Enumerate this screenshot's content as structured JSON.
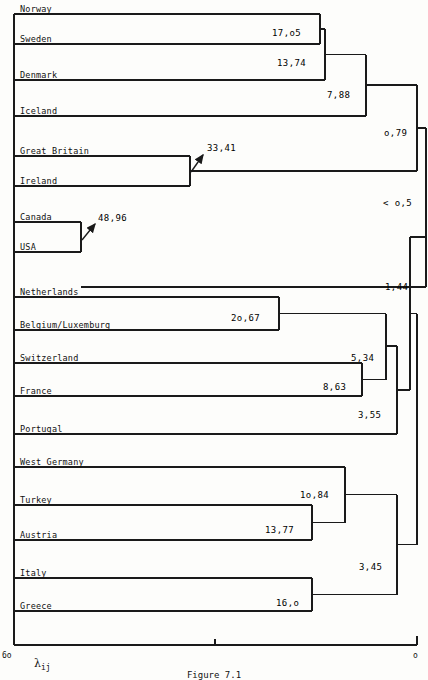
{
  "figure": {
    "caption": "Figure 7.1",
    "axis": {
      "left_tick_label": "6o",
      "right_tick_label": "o",
      "mid_tick_label": "",
      "variable": "λ",
      "variable_sub": "ij",
      "axis_y": 645,
      "axis_left_x": 14,
      "axis_right_x": 417,
      "mid_tick_x": 215
    },
    "colors": {
      "line": "#1a1a1a",
      "background": "#fdfdfb",
      "text": "#111111"
    }
  },
  "chart_data": {
    "type": "dendrogram",
    "title": "Figure 7.1",
    "xlabel": "λij",
    "xlim": [
      60,
      0
    ],
    "axis_direction": "right-to-left",
    "grid": false,
    "legend": "none",
    "leaves": [
      {
        "name": "Norway",
        "y": 14
      },
      {
        "name": "Sweden",
        "y": 44
      },
      {
        "name": "Denmark",
        "y": 80
      },
      {
        "name": "Iceland",
        "y": 116
      },
      {
        "name": "Great Britain",
        "y": 156
      },
      {
        "name": "Ireland",
        "y": 186
      },
      {
        "name": "Canada",
        "y": 222
      },
      {
        "name": "USA",
        "y": 252
      },
      {
        "name": "Netherlands",
        "y": 297
      },
      {
        "name": "Belgium/Luxemburg",
        "y": 330
      },
      {
        "name": "Switzerland",
        "y": 363
      },
      {
        "name": "France",
        "y": 396
      },
      {
        "name": "Portugal",
        "y": 434
      },
      {
        "name": "West Germany",
        "y": 467
      },
      {
        "name": "Turkey",
        "y": 505
      },
      {
        "name": "Austria",
        "y": 540
      },
      {
        "name": "Italy",
        "y": 578
      },
      {
        "name": "Greece",
        "y": 611
      }
    ],
    "merges": [
      {
        "id": "m1",
        "label": "17,o5",
        "value": 17.05,
        "x": 320,
        "children_y": [
          14,
          44
        ],
        "label_x": 272,
        "label_y": 28,
        "arrow": false
      },
      {
        "id": "m2",
        "label": "13,74",
        "value": 13.74,
        "x": 325,
        "children_y": [
          29,
          80
        ],
        "label_x": 277,
        "label_y": 58,
        "arrow": false
      },
      {
        "id": "m3",
        "label": "7,88",
        "value": 7.88,
        "x": 366,
        "children_y": [
          54.5,
          116
        ],
        "label_x": 327,
        "label_y": 90,
        "arrow": false
      },
      {
        "id": "m4",
        "label": "33,41",
        "value": 33.41,
        "x": 190,
        "children_y": [
          156,
          186
        ],
        "label_x": 207,
        "label_y": 143,
        "arrow": true,
        "arrow_from_x": 203,
        "arrow_from_y": 155,
        "arrow_to_x": 191,
        "arrow_to_y": 172
      },
      {
        "id": "m5",
        "label": "48,96",
        "value": 48.96,
        "x": 81,
        "children_y": [
          222,
          252
        ],
        "label_x": 98,
        "label_y": 213,
        "arrow": true,
        "arrow_from_x": 95,
        "arrow_from_y": 224,
        "arrow_to_x": 82,
        "arrow_to_y": 240
      },
      {
        "id": "m6",
        "label": "o,79",
        "value": 0.79,
        "x": 417,
        "children_y": [
          85,
          171
        ],
        "label_x": 384,
        "label_y": 128,
        "arrow": false
      },
      {
        "id": "m7",
        "label": "< o,5",
        "value": 0.5,
        "x": 426,
        "children_y": [
          128,
          287
        ],
        "label_x": 383,
        "label_y": 198,
        "arrow": false
      },
      {
        "id": "m8",
        "label": "2o,67",
        "value": 20.67,
        "x": 279,
        "children_y": [
          297,
          330
        ],
        "label_x": 231,
        "label_y": 313,
        "arrow": false
      },
      {
        "id": "m9",
        "label": "8,63",
        "value": 8.63,
        "x": 362,
        "children_y": [
          363,
          396
        ],
        "label_x": 323,
        "label_y": 382,
        "arrow": false
      },
      {
        "id": "m10",
        "label": "5,34",
        "value": 5.34,
        "x": 386,
        "children_y": [
          313.5,
          379.5
        ],
        "label_x": 351,
        "label_y": 353,
        "arrow": false
      },
      {
        "id": "m11",
        "label": "3,55",
        "value": 3.55,
        "x": 397,
        "children_y": [
          346,
          434
        ],
        "label_x": 358,
        "label_y": 410,
        "arrow": false
      },
      {
        "id": "m12",
        "label": "1,44",
        "value": 1.44,
        "x": 410,
        "children_y": [
          237,
          390
        ],
        "label_x": 385,
        "label_y": 282,
        "arrow": false
      },
      {
        "id": "m13",
        "label": "13,77",
        "value": 13.77,
        "x": 312,
        "children_y": [
          505,
          540
        ],
        "label_x": 265,
        "label_y": 525,
        "arrow": false
      },
      {
        "id": "m14",
        "label": "1o,84",
        "value": 10.84,
        "x": 345,
        "children_y": [
          467,
          522.5
        ],
        "label_x": 300,
        "label_y": 490,
        "arrow": false
      },
      {
        "id": "m15",
        "label": "16,o",
        "value": 16.0,
        "x": 312,
        "children_y": [
          578,
          611
        ],
        "label_x": 276,
        "label_y": 598,
        "arrow": false
      },
      {
        "id": "m16",
        "label": "3,45",
        "value": 3.45,
        "x": 397,
        "children_y": [
          494.75,
          594.5
        ],
        "label_x": 359,
        "label_y": 562,
        "arrow": false
      },
      {
        "id": "m17",
        "label": "",
        "value": null,
        "x": 417,
        "children_y": [
          313.5,
          544.6
        ],
        "label_x": 0,
        "label_y": 0,
        "arrow": false
      }
    ]
  }
}
